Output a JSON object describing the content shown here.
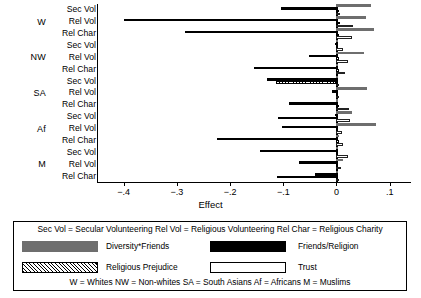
{
  "chart_data": {
    "type": "bar",
    "orientation": "horizontal",
    "title": "",
    "xlabel": "Effect",
    "ylabel": "",
    "xlim": [
      -0.45,
      0.14
    ],
    "xticks": [
      -0.4,
      -0.3,
      -0.2,
      -0.1,
      0,
      0.1
    ],
    "xticklabels": [
      "−.4",
      "−.3",
      "−.2",
      "−.1",
      "0",
      ".1"
    ],
    "grid": false,
    "zero_reference_line": 0,
    "legend_position": "below-plot",
    "series": [
      {
        "name": "Diversity*Friends",
        "key": "diversity_friends",
        "color": "#6e6e6e",
        "fill": "solid-gray"
      },
      {
        "name": "Friends/Religion",
        "key": "friends_religion",
        "color": "#000000",
        "fill": "solid-black"
      },
      {
        "name": "Religious Prejudice",
        "key": "religious_prejudice",
        "color": "#000000",
        "fill": "hatched"
      },
      {
        "name": "Trust",
        "key": "trust",
        "color": "#ffffff",
        "fill": "empty-outline"
      }
    ],
    "row_categories": [
      "Sec Vol",
      "Rel Vol",
      "Rel Char"
    ],
    "groups": [
      {
        "name": "W",
        "rows": [
          {
            "label": "Sec Vol",
            "diversity_friends": 0.065,
            "friends_religion": -0.105,
            "religious_prejudice": 0.004,
            "trust": 0.006
          },
          {
            "label": "Rel Vol",
            "diversity_friends": 0.055,
            "friends_religion": -0.4,
            "religious_prejudice": 0.006,
            "trust": 0.031
          },
          {
            "label": "Rel Char",
            "diversity_friends": 0.07,
            "friends_religion": -0.285,
            "religious_prejudice": 0.005,
            "trust": 0.029
          }
        ]
      },
      {
        "name": "NW",
        "rows": [
          {
            "label": "Sec Vol",
            "diversity_friends": 0.002,
            "friends_religion": -0.002,
            "religious_prejudice": 0.003,
            "trust": 0.013
          },
          {
            "label": "Rel Vol",
            "diversity_friends": 0.052,
            "friends_religion": -0.052,
            "religious_prejudice": 0.004,
            "trust": 0.021
          },
          {
            "label": "Rel Char",
            "diversity_friends": 0.002,
            "friends_religion": -0.155,
            "religious_prejudice": 0.004,
            "trust": 0.016
          }
        ]
      },
      {
        "name": "SA",
        "rows": [
          {
            "label": "Sec Vol",
            "diversity_friends": 0.003,
            "friends_religion": -0.13,
            "religious_prejudice": -0.114,
            "trust": 0.005
          },
          {
            "label": "Rel Vol",
            "diversity_friends": 0.058,
            "friends_religion": -0.008,
            "religious_prejudice": 0.003,
            "trust": 0.005
          },
          {
            "label": "Rel Char",
            "diversity_friends": 0.002,
            "friends_religion": -0.09,
            "religious_prejudice": 0.004,
            "trust": 0.024
          }
        ]
      },
      {
        "name": "Af",
        "rows": [
          {
            "label": "Sec Vol",
            "diversity_friends": 0.03,
            "friends_religion": -0.002,
            "religious_prejudice": -0.11,
            "trust": 0.025
          },
          {
            "label": "Rel Vol",
            "diversity_friends": 0.075,
            "friends_religion": -0.102,
            "religious_prejudice": 0.003,
            "trust": 0.011
          },
          {
            "label": "Rel Char",
            "diversity_friends": 0.004,
            "friends_religion": -0.225,
            "religious_prejudice": 0.004,
            "trust": 0.013
          }
        ]
      },
      {
        "name": "M",
        "rows": [
          {
            "label": "Sec Vol",
            "diversity_friends": 0.002,
            "friends_religion": -0.143,
            "religious_prejudice": 0.002,
            "trust": 0.021
          },
          {
            "label": "Rel Vol",
            "diversity_friends": 0.012,
            "friends_religion": -0.07,
            "religious_prejudice": 0.002,
            "trust": 0.008
          },
          {
            "label": "Rel Char",
            "diversity_friends": 0.003,
            "friends_religion": -0.04,
            "religious_prejudice": -0.112,
            "trust": 0.004
          }
        ]
      }
    ],
    "annotations": {
      "abbrev_line": "Sec Vol = Secular Volunteering  Rel Vol = Religious Volunteering   Rel Char = Religious Charity",
      "group_key_line": "W = Whites NW = Non-whites SA = South Asians Af = Africans M = Muslims"
    }
  },
  "legend": {
    "header": "Sec Vol = Secular Volunteering  Rel Vol = Religious Volunteering   Rel Char = Religious Charity",
    "entries": [
      {
        "label": "Diversity*Friends",
        "swatch": "solid-gray"
      },
      {
        "label": "Friends/Religion",
        "swatch": "solid-black"
      },
      {
        "label": "Religious Prejudice",
        "swatch": "hatched"
      },
      {
        "label": "Trust",
        "swatch": "empty-outline"
      }
    ],
    "footer": "W = Whites NW = Non-whites SA = South Asians Af = Africans M = Muslims"
  }
}
